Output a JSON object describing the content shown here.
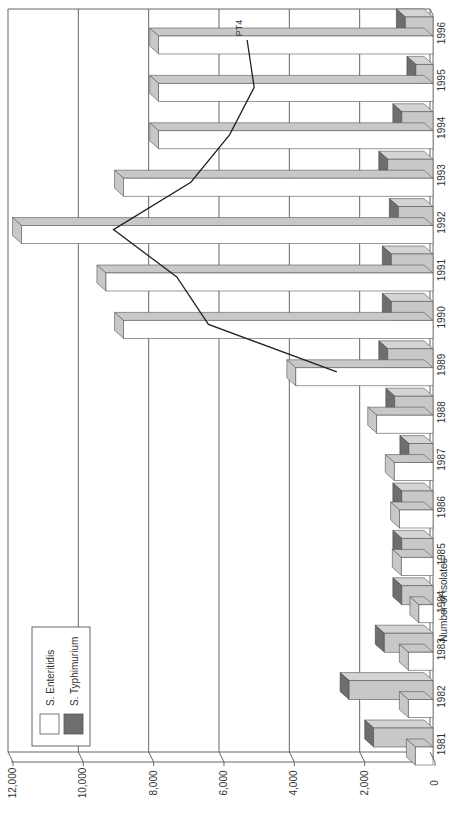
{
  "chart_data": {
    "type": "bar",
    "orientation": "rotated-90-ccw",
    "style": "3d-clustered-bar-with-line",
    "title": "",
    "xlabel": "",
    "ylabel": "Number of isolates",
    "ylim": [
      0,
      12000
    ],
    "yticks": [
      "0",
      "2,000",
      "4,000",
      "6,000",
      "8,000",
      "10,000",
      "12,000"
    ],
    "grid": true,
    "legend_position": "upper-left (rotated)",
    "categories": [
      "1981",
      "1982",
      "1983",
      "1984",
      "1985",
      "1986",
      "1987",
      "1988",
      "1989",
      "1990",
      "1991",
      "1992",
      "1993",
      "1994",
      "1995",
      "1996"
    ],
    "series": [
      {
        "name": "S. Enteritidis",
        "kind": "bar",
        "color": "#ffffff",
        "values": [
          500,
          700,
          700,
          400,
          900,
          950,
          1100,
          1600,
          3900,
          8800,
          9300,
          11700,
          8800,
          7800,
          7800,
          7800
        ]
      },
      {
        "name": "S. Typhimurium",
        "kind": "bar",
        "color": "#6e6e6e",
        "values": [
          1600,
          2300,
          1300,
          800,
          800,
          800,
          600,
          1000,
          1200,
          1100,
          1100,
          900,
          1200,
          800,
          400,
          700
        ]
      },
      {
        "name": "PT4",
        "kind": "line",
        "color": "#222222",
        "values": [
          null,
          null,
          null,
          null,
          null,
          null,
          null,
          null,
          2650,
          6300,
          7200,
          9000,
          6800,
          5700,
          5000,
          5200
        ]
      }
    ],
    "annotations": [
      {
        "text": "PT4",
        "at": "1996"
      }
    ]
  },
  "legend": {
    "items": [
      {
        "label": "S. Enteritidis",
        "swatch": "#ffffff"
      },
      {
        "label": "S. Typhimurium",
        "swatch": "#6e6e6e"
      }
    ]
  },
  "colors": {
    "grid": "#666666",
    "bar_side": "#c8c8c8",
    "bar_top_dark": "#6e6e6e",
    "line": "#222222"
  }
}
